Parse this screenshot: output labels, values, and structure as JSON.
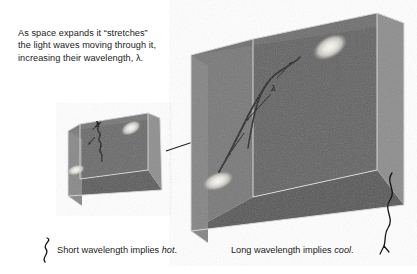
{
  "figure": {
    "background_color": "#ffffff",
    "annotation": {
      "text": "As space expands it “stretches”\nthe light waves moving through it,\nincreasing their wavelength, λ.",
      "color": "#1b1b1b"
    },
    "captions": {
      "short": {
        "lead": "Short wavelength implies ",
        "emphasis": "hot",
        "trail": "."
      },
      "long": {
        "lead": "Long wavelength implies ",
        "emphasis": "cool",
        "trail": "."
      }
    },
    "labels": {
      "lambda_small": "λ",
      "lambda_large": "λ"
    },
    "objects": {
      "small_cube_name": "small-space-cube",
      "large_cube_name": "large-space-cube",
      "expansion_arrow_name": "expansion-arrow",
      "galaxy_name": "galaxy-blob",
      "wave_name": "light-wave"
    },
    "colors": {
      "cube_top_face": "#6f6f6f",
      "cube_back_face": "#636363",
      "cube_left_face": "#7d7d7d",
      "cube_right_face": "#8c8c8c",
      "cube_floor_face": "#5a5a5a",
      "cube_edge": "#d8d8d8",
      "wave_stroke": "#1a1a1a",
      "galaxy_core": "#f2f1ee",
      "galaxy_halo": "#b9b8b4",
      "ink": "#1b1b1b"
    }
  }
}
